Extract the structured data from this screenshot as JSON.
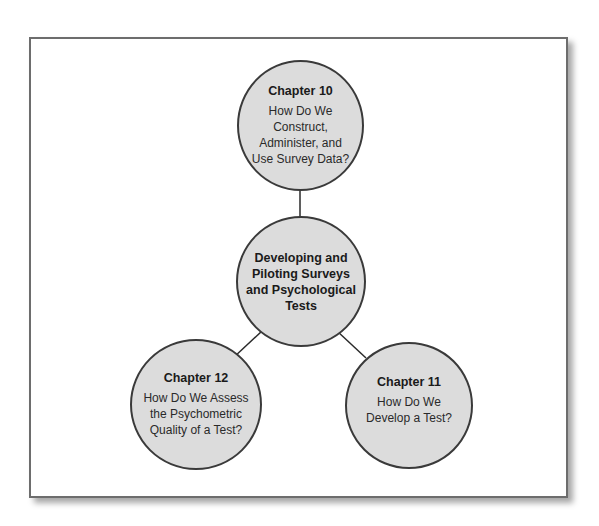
{
  "diagram": {
    "center": {
      "title": "Developing and Piloting Surveys and Psychological Tests"
    },
    "nodes": [
      {
        "position": "top",
        "chapter": "Chapter 10",
        "question": "How Do We Construct, Administer, and Use Survey Data?"
      },
      {
        "position": "bottom-right",
        "chapter": "Chapter 11",
        "question": "How Do We Develop a Test?"
      },
      {
        "position": "bottom-left",
        "chapter": "Chapter 12",
        "question": "How Do We Assess the Psychometric Quality of a Test?"
      }
    ],
    "colors": {
      "node_fill": "#dcdcdc",
      "node_stroke": "#3a3a3a",
      "connector": "#2a2a2a",
      "frame_border": "#6d6d6d"
    }
  }
}
